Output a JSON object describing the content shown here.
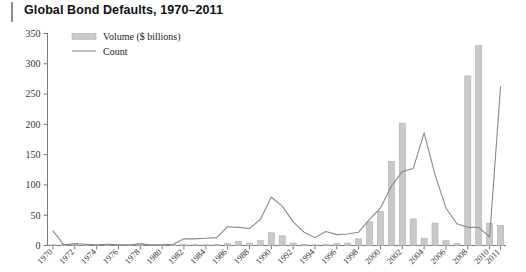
{
  "header": {
    "title": "Global Bond Defaults, 1970–2011"
  },
  "legend": {
    "position": "top-left-inside",
    "entries": [
      {
        "label": "Volume ($ billions)",
        "marker": "bar-swatch",
        "color": "#c9c9c9"
      },
      {
        "label": "Count",
        "marker": "line-swatch",
        "color": "#8a8a8a"
      }
    ]
  },
  "colors": {
    "bar_fill": "#c9c9c9",
    "bar_stroke": "#b0b0b0",
    "line": "#8a8a8a",
    "axis": "#7a7a7a",
    "text": "#333333",
    "title": "#111111",
    "accent_rule": "#8d8d8d",
    "background": "#ffffff"
  },
  "chart_data": {
    "type": "bar",
    "title": "Global Bond Defaults, 1970–2011",
    "xlabel": "",
    "ylabel": "",
    "ylim": [
      0,
      350
    ],
    "yticks": [
      0,
      50,
      100,
      150,
      200,
      250,
      300,
      350
    ],
    "grid": false,
    "legend_position": "upper left",
    "categories": [
      "1970",
      "1971",
      "1972",
      "1973",
      "1974",
      "1975",
      "1976",
      "1977",
      "1978",
      "1979",
      "1980",
      "1981",
      "1982",
      "1983",
      "1984",
      "1985",
      "1986",
      "1987",
      "1988",
      "1989",
      "1990",
      "1991",
      "1992",
      "1993",
      "1994",
      "1995",
      "1996",
      "1997",
      "1998",
      "1999",
      "2000",
      "2001",
      "2002",
      "2003",
      "2004",
      "2005",
      "2006",
      "2007",
      "2008",
      "2009",
      "2010",
      "2011"
    ],
    "xtick_labels": [
      "1970",
      "1972",
      "1974",
      "1976",
      "1978",
      "1980",
      "1982",
      "1984",
      "1986",
      "1988",
      "1990",
      "1992",
      "1994",
      "1996",
      "1998",
      "2000",
      "2002",
      "2004",
      "2006",
      "2008",
      "2010",
      "2011"
    ],
    "series": [
      {
        "name": "Volume ($ billions)",
        "type": "bar",
        "color": "#c9c9c9",
        "values": [
          1,
          2,
          3,
          1,
          1,
          2,
          1,
          1,
          3,
          1,
          1,
          1,
          2,
          2,
          1,
          2,
          3,
          7,
          4,
          8,
          21,
          16,
          4,
          2,
          1,
          2,
          3,
          4,
          11,
          39,
          56,
          139,
          202,
          44,
          12,
          37,
          8,
          3,
          280,
          330,
          37,
          33
        ]
      },
      {
        "name": "Count",
        "type": "line",
        "color": "#8a8a8a",
        "values": [
          24,
          1,
          3,
          2,
          1,
          2,
          1,
          1,
          3,
          1,
          1,
          2,
          11,
          11,
          12,
          13,
          31,
          30,
          28,
          43,
          80,
          65,
          39,
          22,
          13,
          23,
          18,
          19,
          22,
          43,
          62,
          98,
          122,
          127,
          186,
          117,
          62,
          36,
          30,
          30,
          14,
          262
        ],
        "note_shape": "1970 starts near 24, drops to ~0 through the 1970s, steps to ~11 in 1982, rises to a ~80 peak in 1990, dips mid-1990s, climbs to ~186 peak in 2001, falls to ~15 by 2008, spikes to ~262 in 2009, then falls to ~35 by 2011"
      }
    ]
  }
}
